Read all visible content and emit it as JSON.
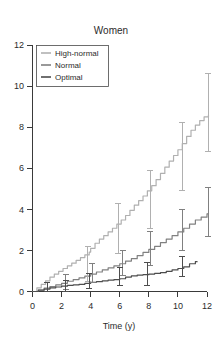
{
  "chart_data": {
    "type": "line",
    "title": "Women",
    "xlabel": "Time (y)",
    "ylabel": "",
    "xlim": [
      0,
      12
    ],
    "ylim": [
      0,
      12
    ],
    "xticks": [
      0,
      2,
      4,
      6,
      8,
      10,
      12
    ],
    "yticks": [
      0,
      2,
      4,
      6,
      8,
      10,
      12
    ],
    "xtick_labels": [
      "0",
      "2",
      "4",
      "6",
      "8",
      "10",
      "12"
    ],
    "ytick_labels": [
      "0",
      "2",
      "4",
      "6",
      "8",
      "10",
      "12"
    ],
    "grid": false,
    "legend_position": "top-left",
    "series": [
      {
        "name": "High-normal",
        "color": "#b0b0b0",
        "x": [
          0,
          0.3,
          0.6,
          0.9,
          1.2,
          1.5,
          1.8,
          2.1,
          2.4,
          2.7,
          3.0,
          3.3,
          3.6,
          3.9,
          4.0,
          4.3,
          4.6,
          4.9,
          5.2,
          5.5,
          5.8,
          6.1,
          6.4,
          6.7,
          7.0,
          7.3,
          7.6,
          7.9,
          8.2,
          8.5,
          8.8,
          9.1,
          9.4,
          9.7,
          10.0,
          10.3,
          10.6,
          10.9,
          11.2,
          11.5,
          11.8,
          12.1
        ],
        "y": [
          0.0,
          0.18,
          0.35,
          0.52,
          0.7,
          0.85,
          0.98,
          1.12,
          1.25,
          1.38,
          1.52,
          1.65,
          1.78,
          1.92,
          2.1,
          2.35,
          2.55,
          2.72,
          2.9,
          3.08,
          3.28,
          3.48,
          3.7,
          3.95,
          4.2,
          4.42,
          4.65,
          4.9,
          5.15,
          5.45,
          5.75,
          6.05,
          6.35,
          6.62,
          6.9,
          7.2,
          7.55,
          7.85,
          8.1,
          8.32,
          8.5,
          8.6
        ],
        "error_bars": [
          {
            "x": 3.8,
            "y": 1.35,
            "low": 0.5,
            "high": 2.18
          },
          {
            "x": 5.9,
            "y": 2.75,
            "low": 1.85,
            "high": 4.3
          },
          {
            "x": 8.1,
            "y": 4.45,
            "low": 3.05,
            "high": 5.9
          },
          {
            "x": 10.3,
            "y": 6.5,
            "low": 4.9,
            "high": 8.25
          },
          {
            "x": 12.1,
            "y": 8.6,
            "low": 6.8,
            "high": 10.6
          }
        ]
      },
      {
        "name": "Normal",
        "color": "#808080",
        "x": [
          0,
          0.4,
          0.8,
          1.2,
          1.6,
          2.0,
          2.4,
          2.8,
          3.2,
          3.6,
          4.0,
          4.4,
          4.8,
          5.2,
          5.6,
          6.0,
          6.4,
          6.8,
          7.2,
          7.6,
          8.0,
          8.4,
          8.8,
          9.2,
          9.6,
          10.0,
          10.4,
          10.8,
          11.2,
          11.6,
          12.0,
          12.1
        ],
        "y": [
          0.0,
          0.08,
          0.16,
          0.24,
          0.32,
          0.4,
          0.5,
          0.58,
          0.66,
          0.75,
          0.85,
          0.95,
          1.05,
          1.15,
          1.25,
          1.35,
          1.48,
          1.6,
          1.75,
          1.9,
          2.05,
          2.2,
          2.38,
          2.55,
          2.72,
          2.9,
          3.08,
          3.28,
          3.48,
          3.62,
          3.78,
          3.82
        ],
        "error_bars": [
          {
            "x": 2.3,
            "y": 0.45,
            "low": 0.1,
            "high": 0.82
          },
          {
            "x": 4.1,
            "y": 0.88,
            "low": 0.42,
            "high": 1.38
          },
          {
            "x": 6.2,
            "y": 1.38,
            "low": 0.8,
            "high": 2.0
          },
          {
            "x": 8.1,
            "y": 2.08,
            "low": 1.25,
            "high": 2.92
          },
          {
            "x": 10.3,
            "y": 2.95,
            "low": 2.0,
            "high": 4.0
          },
          {
            "x": 12.1,
            "y": 3.82,
            "low": 2.68,
            "high": 5.05
          }
        ]
      },
      {
        "name": "Optimal",
        "color": "#4d4d4d",
        "x": [
          0,
          0.4,
          0.8,
          1.2,
          1.6,
          2.0,
          2.4,
          2.8,
          3.2,
          3.6,
          4.0,
          4.4,
          4.8,
          5.2,
          5.6,
          6.0,
          6.4,
          6.8,
          7.2,
          7.6,
          8.0,
          8.4,
          8.8,
          9.2,
          9.6,
          10.0,
          10.4,
          10.8,
          11.2,
          11.35
        ],
        "y": [
          0.0,
          0.06,
          0.12,
          0.18,
          0.22,
          0.26,
          0.3,
          0.32,
          0.35,
          0.4,
          0.45,
          0.48,
          0.52,
          0.55,
          0.58,
          0.62,
          0.7,
          0.76,
          0.8,
          0.82,
          0.85,
          0.88,
          0.92,
          0.98,
          1.05,
          1.12,
          1.2,
          1.35,
          1.45,
          1.45
        ],
        "error_bars": [
          {
            "x": 1.0,
            "y": 0.18,
            "low": 0.0,
            "high": 0.45
          },
          {
            "x": 2.3,
            "y": 0.22,
            "low": 0.0,
            "high": 0.52
          },
          {
            "x": 3.9,
            "y": 0.42,
            "low": 0.14,
            "high": 0.88
          },
          {
            "x": 6.0,
            "y": 0.62,
            "low": 0.28,
            "high": 1.18
          },
          {
            "x": 7.9,
            "y": 0.85,
            "low": 0.28,
            "high": 1.42
          },
          {
            "x": 10.3,
            "y": 1.18,
            "low": 0.72,
            "high": 1.68
          }
        ]
      }
    ]
  },
  "legend": {
    "entries": [
      {
        "label": "High-normal"
      },
      {
        "label": "Normal"
      },
      {
        "label": "Optimal"
      }
    ]
  }
}
